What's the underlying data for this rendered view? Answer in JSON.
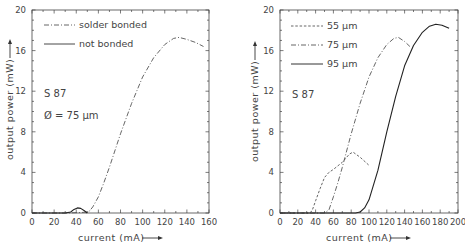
{
  "chart_data": [
    {
      "type": "line",
      "title": "",
      "xlabel": "current (mA)",
      "ylabel": "output power (mW)",
      "xlim": [
        0,
        160
      ],
      "ylim": [
        0,
        20
      ],
      "xticks": [
        0,
        20,
        40,
        60,
        80,
        100,
        120,
        140,
        160
      ],
      "yticks": [
        0,
        4,
        8,
        12,
        16,
        20
      ],
      "grid": false,
      "legend_position": "upper-left",
      "annotations": [
        "S 87",
        "Ø = 75 µm"
      ],
      "series": [
        {
          "name": "solder bonded",
          "style": "dash-dot",
          "x": [
            0,
            30,
            45,
            50,
            52,
            55,
            60,
            65,
            70,
            80,
            90,
            100,
            110,
            120,
            128,
            133,
            140,
            148,
            155
          ],
          "y": [
            0,
            0,
            0.05,
            0.1,
            0.2,
            0.6,
            1.6,
            3.0,
            4.5,
            7.8,
            10.8,
            13.4,
            15.3,
            16.6,
            17.2,
            17.3,
            17.1,
            16.8,
            16.4
          ]
        },
        {
          "name": "not bonded",
          "style": "solid",
          "x": [
            0,
            30,
            35,
            38,
            41,
            44,
            47,
            50
          ],
          "y": [
            0,
            0,
            0.1,
            0.35,
            0.5,
            0.45,
            0.25,
            0
          ]
        }
      ]
    },
    {
      "type": "line",
      "title": "",
      "xlabel": "current (mA)",
      "ylabel": "output power (mW)",
      "xlim": [
        0,
        200
      ],
      "ylim": [
        0,
        20
      ],
      "xticks": [
        0,
        20,
        40,
        60,
        80,
        100,
        120,
        140,
        160,
        180,
        200
      ],
      "yticks": [
        0,
        4,
        8,
        12,
        16,
        20
      ],
      "grid": false,
      "legend_position": "upper-left",
      "annotations": [
        "S 87"
      ],
      "series": [
        {
          "name": "55 µm",
          "style": "dashed",
          "x": [
            0,
            33,
            36,
            40,
            45,
            50,
            55,
            60,
            70,
            78,
            82,
            90,
            100
          ],
          "y": [
            0,
            0,
            0.2,
            1.2,
            2.4,
            3.5,
            4.0,
            4.3,
            5.0,
            5.8,
            6.0,
            5.5,
            4.7
          ]
        },
        {
          "name": "75 µm",
          "style": "dash-dot",
          "x": [
            0,
            50,
            55,
            60,
            65,
            70,
            80,
            90,
            100,
            110,
            120,
            128,
            133,
            140,
            146
          ],
          "y": [
            0,
            0,
            0.3,
            1.6,
            3.0,
            4.5,
            7.8,
            10.8,
            13.4,
            15.3,
            16.6,
            17.2,
            17.3,
            16.9,
            16.4
          ]
        },
        {
          "name": "95 µm",
          "style": "solid",
          "x": [
            0,
            85,
            90,
            95,
            100,
            110,
            120,
            130,
            140,
            150,
            160,
            168,
            175,
            182,
            190
          ],
          "y": [
            0,
            0,
            0.1,
            0.5,
            1.3,
            4.2,
            8.0,
            11.5,
            14.5,
            16.5,
            17.8,
            18.4,
            18.6,
            18.5,
            18.2
          ]
        }
      ]
    }
  ],
  "labels": {
    "left": {
      "xlabel": "current (mA)",
      "ylabel": "output power (mW)",
      "legend": [
        "solder bonded",
        "not bonded"
      ],
      "annot1": "S 87",
      "annot2": "Ø = 75 µm",
      "xticks": [
        "0",
        "20",
        "40",
        "60",
        "80",
        "100",
        "120",
        "140",
        "160"
      ],
      "yticks": [
        "0",
        "4",
        "8",
        "12",
        "16",
        "20"
      ]
    },
    "right": {
      "xlabel": "current (mA)",
      "ylabel": "output power (mW)",
      "legend": [
        "55 µm",
        "75 µm",
        "95 µm"
      ],
      "annot1": "S 87",
      "xticks": [
        "0",
        "20",
        "40",
        "60",
        "80",
        "100",
        "120",
        "140",
        "160",
        "180",
        "200"
      ],
      "yticks": [
        "0",
        "4",
        "8",
        "12",
        "16",
        "20"
      ]
    }
  }
}
